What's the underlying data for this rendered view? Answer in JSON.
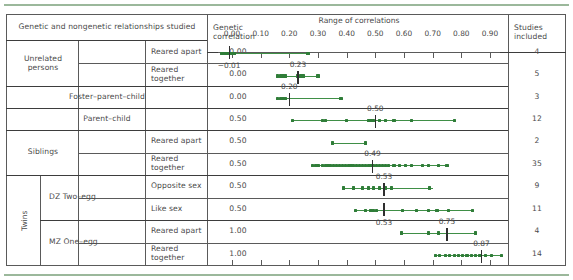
{
  "table": {
    "headers": {
      "relationships": "Genetic and nongenetic relationships studied",
      "genetic_correlation": "Genetic correlation",
      "range": "Range of correlations",
      "studies": "Studies included"
    },
    "groups": {
      "unrelated": "Unrelated persons",
      "foster": "Foster–parent–child",
      "parent": "Parent–child",
      "siblings": "Siblings",
      "twins": "Twins",
      "dz": "DZ Two–egg",
      "mz": "MZ One–egg"
    },
    "rows": [
      {
        "sub": "Reared apart",
        "genetic_correlation": "0.00",
        "studies": "4"
      },
      {
        "sub": "Reared together",
        "genetic_correlation": "0.00",
        "studies": "5"
      },
      {
        "sub": "",
        "genetic_correlation": "0.00",
        "studies": "3"
      },
      {
        "sub": "",
        "genetic_correlation": "0.50",
        "studies": "12"
      },
      {
        "sub": "Reared apart",
        "genetic_correlation": "0.50",
        "studies": "2"
      },
      {
        "sub": "Reared together",
        "genetic_correlation": "0.50",
        "studies": "35"
      },
      {
        "sub": "Opposite sex",
        "genetic_correlation": "0.50",
        "studies": "9"
      },
      {
        "sub": "Like sex",
        "genetic_correlation": "0.50",
        "studies": "11"
      },
      {
        "sub": "Reared apart",
        "genetic_correlation": "1.00",
        "studies": "4"
      },
      {
        "sub": "Reared together",
        "genetic_correlation": "1.00",
        "studies": "14"
      }
    ]
  },
  "chart_data": {
    "type": "scatter",
    "title": "Range of correlations",
    "xlabel": "",
    "ylabel": "",
    "xlim": [
      -0.05,
      1.0
    ],
    "grid": false,
    "ticks": [
      "0.00",
      "0.10",
      "0.20",
      "0.30",
      "0.40",
      "0.50",
      "0.60",
      "0.70",
      "0.80",
      "0.90"
    ],
    "tick_values": [
      0.0,
      0.1,
      0.2,
      0.3,
      0.4,
      0.5,
      0.6,
      0.7,
      0.8,
      0.9
    ],
    "accent_color": "#3f8f46",
    "series": [
      {
        "name": "Unrelated persons, reared apart",
        "median": -0.01,
        "median_label": "−0.01",
        "median_label_side": "below",
        "range": [
          -0.04,
          0.27
        ],
        "points": [
          -0.035,
          -0.028,
          -0.02,
          -0.012,
          -0.005,
          0.003,
          0.01,
          0.265
        ]
      },
      {
        "name": "Unrelated persons, reared together",
        "median": 0.23,
        "median_label": "0.23",
        "median_label_side": "above",
        "range": [
          0.155,
          0.305
        ],
        "points": [
          0.158,
          0.168,
          0.178,
          0.188,
          0.228,
          0.238,
          0.248,
          0.3
        ]
      },
      {
        "name": "Foster–parent–child",
        "median": 0.2,
        "median_label": "0.20",
        "median_label_side": "above",
        "range": [
          0.155,
          0.385
        ],
        "points": [
          0.158,
          0.168,
          0.178,
          0.188,
          0.38
        ]
      },
      {
        "name": "Parent–child",
        "median": 0.5,
        "median_label": "0.50",
        "median_label_side": "above",
        "range": [
          0.205,
          0.78
        ],
        "points": [
          0.21,
          0.315,
          0.325,
          0.4,
          0.475,
          0.485,
          0.495,
          0.515,
          0.535,
          0.565,
          0.625,
          0.775
        ]
      },
      {
        "name": "Siblings, reared apart",
        "median": null,
        "median_label": "",
        "median_label_side": "above",
        "range": [
          0.345,
          0.47
        ],
        "points": [
          0.35,
          0.465
        ]
      },
      {
        "name": "Siblings, reared together",
        "median": 0.49,
        "median_label": "0.49",
        "median_label_side": "above",
        "range": [
          0.275,
          0.755
        ],
        "points": [
          0.28,
          0.29,
          0.3,
          0.315,
          0.325,
          0.335,
          0.345,
          0.355,
          0.365,
          0.375,
          0.385,
          0.395,
          0.405,
          0.415,
          0.425,
          0.435,
          0.445,
          0.455,
          0.465,
          0.475,
          0.485,
          0.495,
          0.505,
          0.515,
          0.525,
          0.535,
          0.545,
          0.565,
          0.585,
          0.605,
          0.625,
          0.665,
          0.685,
          0.72,
          0.75
        ]
      },
      {
        "name": "Twins DZ, opposite sex",
        "median": 0.53,
        "median_label": "0.53",
        "median_label_side": "above",
        "range": [
          0.385,
          0.7
        ],
        "points": [
          0.39,
          0.425,
          0.455,
          0.475,
          0.495,
          0.515,
          0.535,
          0.555,
          0.69
        ]
      },
      {
        "name": "Twins DZ, like sex",
        "median": 0.53,
        "median_label": "0.53",
        "median_label_side": "below",
        "range": [
          0.425,
          0.845
        ],
        "points": [
          0.43,
          0.465,
          0.485,
          0.495,
          0.505,
          0.595,
          0.645,
          0.685,
          0.715,
          0.755,
          0.84
        ]
      },
      {
        "name": "Twins MZ, reared apart",
        "median": 0.75,
        "median_label": "0.75",
        "median_label_side": "above",
        "range": [
          0.585,
          0.855
        ],
        "points": [
          0.59,
          0.685,
          0.72,
          0.85
        ]
      },
      {
        "name": "Twins MZ, reared together",
        "median": 0.87,
        "median_label": "0.87",
        "median_label_side": "above",
        "range": [
          0.705,
          0.945
        ],
        "points": [
          0.71,
          0.725,
          0.745,
          0.76,
          0.775,
          0.79,
          0.805,
          0.82,
          0.835,
          0.85,
          0.865,
          0.885,
          0.905,
          0.94
        ]
      }
    ]
  }
}
